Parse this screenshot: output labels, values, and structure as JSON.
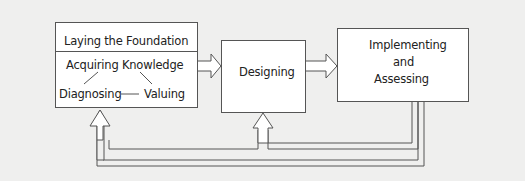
{
  "diagram": {
    "type": "process-flow",
    "boxes": {
      "foundation": {
        "title": "Laying the Foundation",
        "sub_top": "Acquiring Knowledge",
        "sub_left": "Diagnosing",
        "sub_right": "Valuing"
      },
      "designing": {
        "label": "Designing"
      },
      "implementing": {
        "line1": "Implementing",
        "line2": "and",
        "line3": "Assessing"
      }
    },
    "arrows": [
      {
        "from": "foundation",
        "to": "designing",
        "style": "hollow"
      },
      {
        "from": "designing",
        "to": "implementing",
        "style": "hollow"
      },
      {
        "from": "implementing",
        "to": "designing",
        "style": "hollow-feedback"
      },
      {
        "from": "implementing",
        "to": "foundation",
        "style": "hollow-feedback"
      }
    ],
    "colors": {
      "background": "#efefee",
      "box_fill": "#ffffff",
      "stroke": "#555555"
    }
  }
}
